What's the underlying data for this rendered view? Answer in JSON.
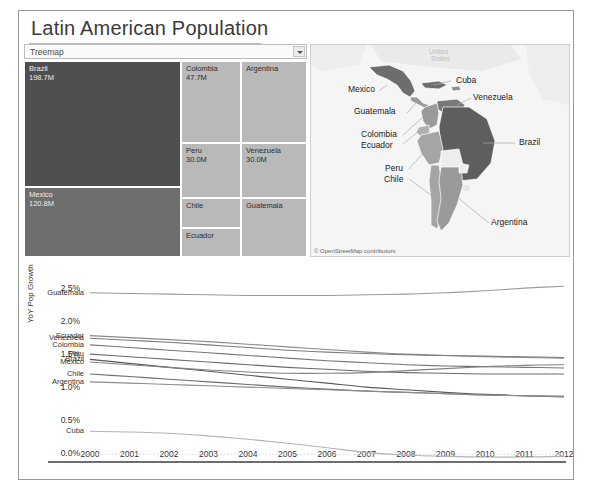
{
  "dashboard": {
    "title": "Latin American Population",
    "view_selector": {
      "value": "Treemap",
      "options": [
        "Treemap",
        "Map",
        "Bar Chart"
      ]
    }
  },
  "treemap": {
    "tiles": [
      {
        "name": "Brazil",
        "value": "198.7M",
        "pop": 198.7,
        "shade": "dark"
      },
      {
        "name": "Mexico",
        "value": "120.8M",
        "pop": 120.8,
        "shade": "mid"
      },
      {
        "name": "Colombia",
        "value": "47.7M",
        "pop": 47.7,
        "shade": "light"
      },
      {
        "name": "Argentina",
        "value": "",
        "pop": 41.1,
        "shade": "light"
      },
      {
        "name": "Peru",
        "value": "30.0M",
        "pop": 30.0,
        "shade": "light"
      },
      {
        "name": "Venezuela",
        "value": "30.0M",
        "pop": 30.0,
        "shade": "light"
      },
      {
        "name": "Chile",
        "value": "",
        "pop": 17.4,
        "shade": "light"
      },
      {
        "name": "Guatemala",
        "value": "",
        "pop": 15.1,
        "shade": "light"
      },
      {
        "name": "Ecuador",
        "value": "",
        "pop": 15.5,
        "shade": "light"
      },
      {
        "name": "Cuba",
        "value": "",
        "pop": 11.3,
        "shade": "light"
      }
    ]
  },
  "map": {
    "attribution": "© OpenStreetMap contributors",
    "background_label": "United States",
    "labels": [
      {
        "name": "Mexico"
      },
      {
        "name": "Guatemala"
      },
      {
        "name": "Cuba"
      },
      {
        "name": "Venezuela"
      },
      {
        "name": "Colombia"
      },
      {
        "name": "Ecuador"
      },
      {
        "name": "Brazil"
      },
      {
        "name": "Peru"
      },
      {
        "name": "Chile"
      },
      {
        "name": "Argentina"
      }
    ]
  },
  "chart_data": {
    "type": "line",
    "title": "",
    "xlabel": "",
    "ylabel": "YoY Pop Growth",
    "x": [
      2000,
      2001,
      2002,
      2003,
      2004,
      2005,
      2006,
      2007,
      2008,
      2009,
      2010,
      2011,
      2012
    ],
    "xticklabels": [
      "2000",
      "2001",
      "2002",
      "2003",
      "2004",
      "2005",
      "2006",
      "2007",
      "2008",
      "2009",
      "2010",
      "2011",
      "2012"
    ],
    "yticklabels": [
      "0.0%",
      "0.5%",
      "1.0%",
      "1.5%",
      "2.0%",
      "2.5%"
    ],
    "ylim": [
      -0.1,
      2.75
    ],
    "ytick_values": [
      0.0,
      0.5,
      1.0,
      1.5,
      2.0,
      2.5
    ],
    "grid": false,
    "zero_line": true,
    "legend_position": "inline-left",
    "series": [
      {
        "name": "Guatemala",
        "values": [
          2.45,
          2.44,
          2.43,
          2.42,
          2.41,
          2.41,
          2.41,
          2.42,
          2.43,
          2.45,
          2.48,
          2.52,
          2.55
        ]
      },
      {
        "name": "Ecuador",
        "values": [
          1.8,
          1.77,
          1.74,
          1.71,
          1.67,
          1.63,
          1.59,
          1.55,
          1.52,
          1.5,
          1.48,
          1.47,
          1.46
        ]
      },
      {
        "name": "Venezuela",
        "values": [
          1.76,
          1.73,
          1.7,
          1.66,
          1.62,
          1.58,
          1.55,
          1.53,
          1.51,
          1.5,
          1.49,
          1.48,
          1.47
        ]
      },
      {
        "name": "Colombia",
        "values": [
          1.66,
          1.62,
          1.58,
          1.54,
          1.5,
          1.46,
          1.42,
          1.39,
          1.36,
          1.34,
          1.33,
          1.32,
          1.31
        ]
      },
      {
        "name": "Peru",
        "values": [
          1.52,
          1.48,
          1.44,
          1.4,
          1.36,
          1.32,
          1.29,
          1.26,
          1.24,
          1.23,
          1.22,
          1.22,
          1.22
        ]
      },
      {
        "name": "Brazil",
        "values": [
          1.44,
          1.38,
          1.32,
          1.26,
          1.2,
          1.14,
          1.08,
          1.02,
          0.98,
          0.94,
          0.91,
          0.89,
          0.87
        ]
      },
      {
        "name": "Mexico",
        "values": [
          1.4,
          1.36,
          1.32,
          1.28,
          1.25,
          1.23,
          1.23,
          1.24,
          1.27,
          1.3,
          1.33,
          1.35,
          1.36
        ]
      },
      {
        "name": "Chile",
        "values": [
          1.22,
          1.18,
          1.14,
          1.1,
          1.06,
          1.02,
          0.99,
          0.96,
          0.94,
          0.92,
          0.9,
          0.89,
          0.88
        ]
      },
      {
        "name": "Argentina",
        "values": [
          1.1,
          1.08,
          1.06,
          1.04,
          1.02,
          1.0,
          0.98,
          0.96,
          0.94,
          0.92,
          0.9,
          0.89,
          0.88
        ]
      },
      {
        "name": "Cuba",
        "values": [
          0.35,
          0.34,
          0.32,
          0.28,
          0.23,
          0.17,
          0.1,
          0.03,
          -0.01,
          -0.03,
          -0.04,
          -0.04,
          -0.03
        ]
      }
    ]
  }
}
